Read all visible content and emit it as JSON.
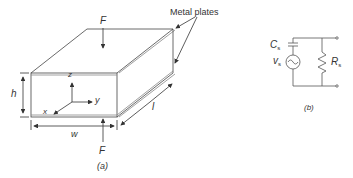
{
  "figure_a": {
    "caption": "(a)",
    "force_label_top": "F",
    "force_label_bottom": "F",
    "metal_plates_label": "Metal plates",
    "axes": {
      "z": "z",
      "y": "y",
      "x": "x"
    },
    "dimensions": {
      "height": "h",
      "width": "w",
      "length": "l"
    }
  },
  "figure_b": {
    "caption": "(b)",
    "capacitor_label": "C",
    "capacitor_sub": "s",
    "source_label": "v",
    "source_sub": "s",
    "resistor_label": "R",
    "resistor_sub": "s"
  },
  "colors": {
    "line": "#333333",
    "background": "#ffffff"
  }
}
